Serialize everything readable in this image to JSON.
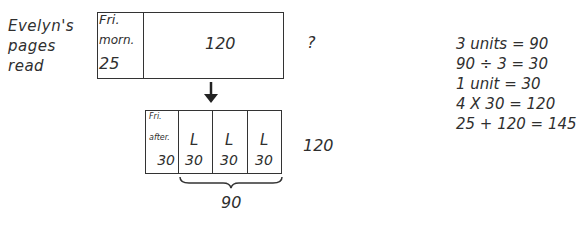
{
  "label": [
    "Evelyn's",
    "pages",
    "read"
  ],
  "top_bar": {
    "first_unit": {
      "line1": "Fri.",
      "line2": "morn.",
      "value": "25"
    },
    "rest_value": "120",
    "total": "?"
  },
  "arrow": "down-arrow",
  "bottom_bar": {
    "first_unit": {
      "line1": "Fri.",
      "line2": "after.",
      "value": "30"
    },
    "units": [
      {
        "letter": "L",
        "value": "30"
      },
      {
        "letter": "L",
        "value": "30"
      },
      {
        "letter": "L",
        "value": "30"
      }
    ],
    "total": "120",
    "brace_label": "90"
  },
  "steps": [
    "3 units = 90",
    "90 ÷ 3 = 30",
    "1 unit = 30",
    "4 X 30 = 120",
    "25 + 120 = 145"
  ]
}
